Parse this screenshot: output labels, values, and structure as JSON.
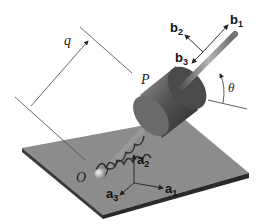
{
  "diagram": {
    "labels": {
      "q": "q",
      "P": "P",
      "O": "O",
      "theta": "θ",
      "b1": "b",
      "b1_sub": "1",
      "b2": "b",
      "b2_sub": "2",
      "b3": "b",
      "b3_sub": "3",
      "a1": "a",
      "a1_sub": "1",
      "a2": "a",
      "a2_sub": "2",
      "a3": "a",
      "a3_sub": "3"
    },
    "colors": {
      "plate_top": "#8c8c8c",
      "plate_edge": "#3a3a3a",
      "cylinder_body": "#5a5a5a",
      "cylinder_face": "#4a4a4a",
      "rod": "#8a8a8a",
      "spring": "#2e2e2e",
      "line": "#333333"
    }
  }
}
